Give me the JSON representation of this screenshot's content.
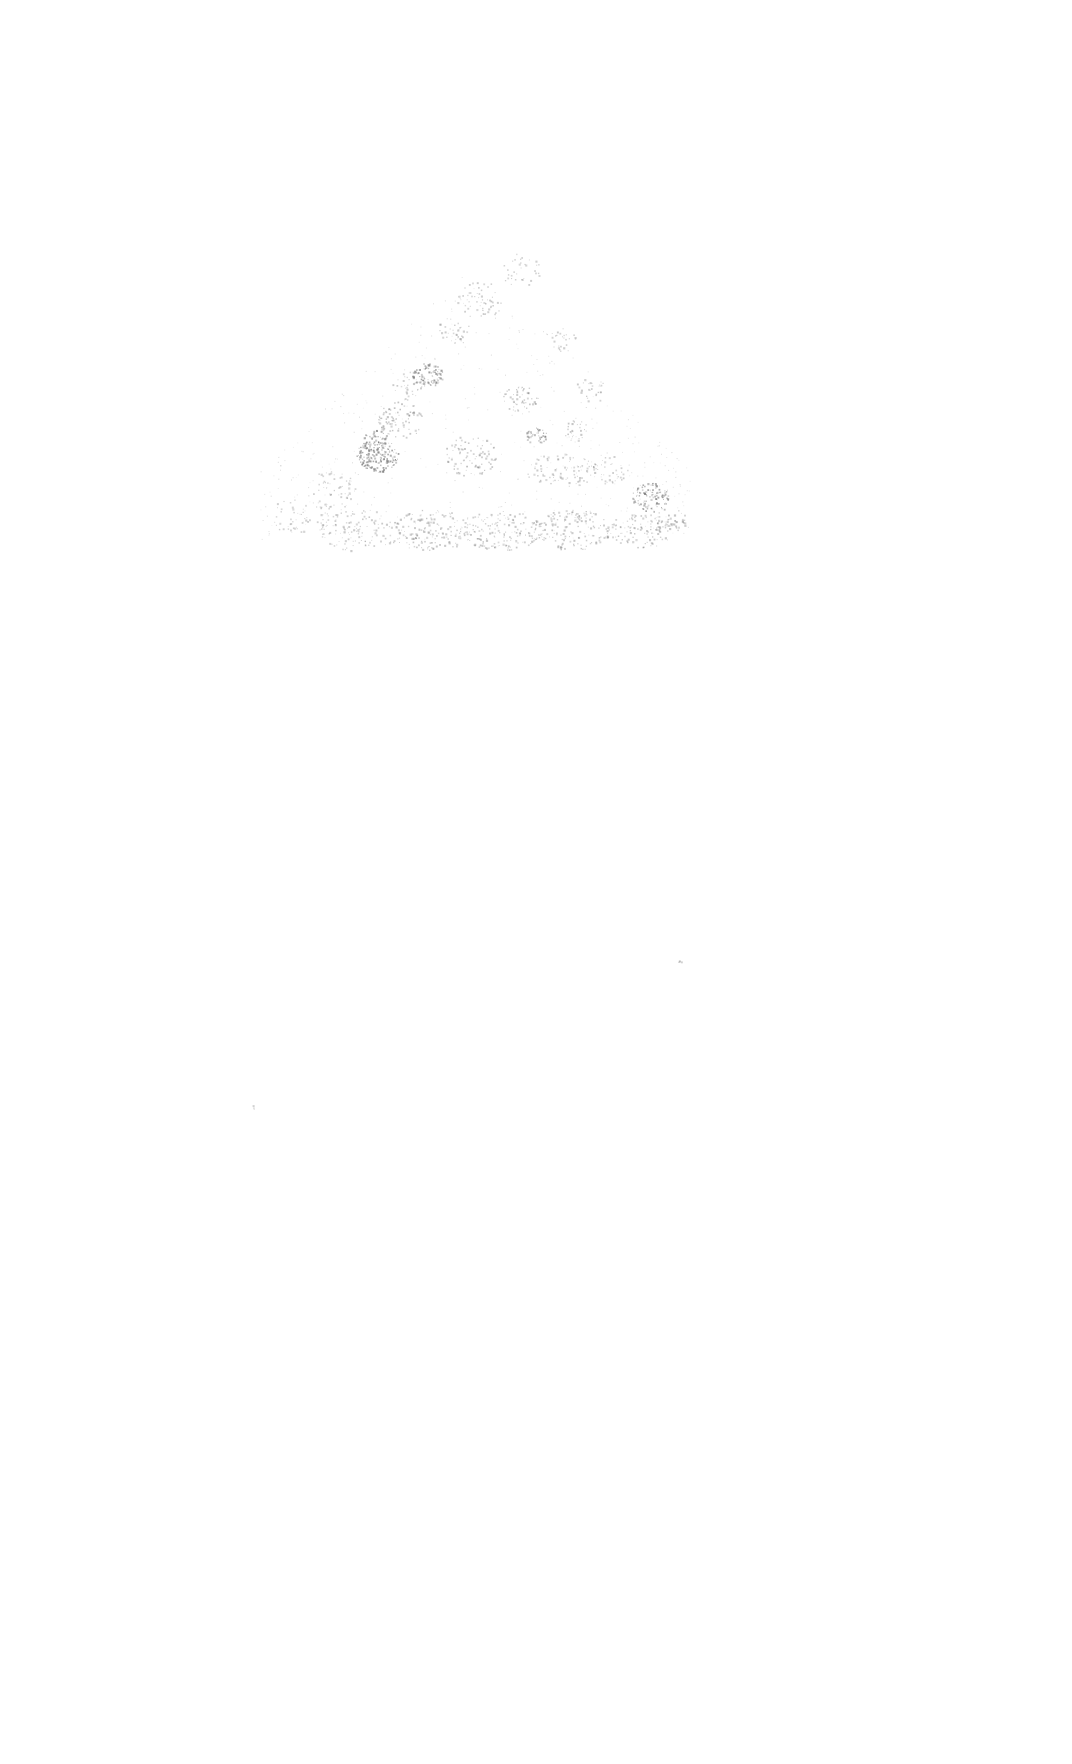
{
  "canvas": {
    "width": 1072,
    "height": 1764,
    "background": "#ffffff",
    "speckle_color": "#6f6f6f"
  },
  "texture": {
    "description": "faint grey speckled spray texture forming a low mound shape",
    "region": {
      "x": 260,
      "y": 260,
      "width": 430,
      "height": 280
    },
    "clusters": [
      {
        "x": 427,
        "y": 375,
        "r": 12,
        "density": 0.7
      },
      {
        "x": 377,
        "y": 455,
        "r": 16,
        "density": 0.75
      },
      {
        "x": 375,
        "y": 440,
        "r": 10,
        "density": 0.6
      },
      {
        "x": 536,
        "y": 435,
        "r": 8,
        "density": 0.65
      },
      {
        "x": 650,
        "y": 497,
        "r": 14,
        "density": 0.6
      },
      {
        "x": 575,
        "y": 430,
        "r": 10,
        "density": 0.3
      },
      {
        "x": 520,
        "y": 400,
        "r": 14,
        "density": 0.3
      },
      {
        "x": 480,
        "y": 300,
        "r": 18,
        "density": 0.2
      },
      {
        "x": 520,
        "y": 270,
        "r": 16,
        "density": 0.15
      },
      {
        "x": 455,
        "y": 330,
        "r": 14,
        "density": 0.2
      },
      {
        "x": 560,
        "y": 340,
        "r": 12,
        "density": 0.2
      },
      {
        "x": 400,
        "y": 420,
        "r": 18,
        "density": 0.3
      },
      {
        "x": 470,
        "y": 455,
        "r": 20,
        "density": 0.25
      },
      {
        "x": 560,
        "y": 470,
        "r": 22,
        "density": 0.2
      },
      {
        "x": 610,
        "y": 470,
        "r": 14,
        "density": 0.2
      },
      {
        "x": 330,
        "y": 490,
        "r": 20,
        "density": 0.15
      },
      {
        "x": 300,
        "y": 515,
        "r": 22,
        "density": 0.12
      },
      {
        "x": 360,
        "y": 530,
        "r": 26,
        "density": 0.2
      },
      {
        "x": 430,
        "y": 530,
        "r": 26,
        "density": 0.25
      },
      {
        "x": 500,
        "y": 530,
        "r": 26,
        "density": 0.25
      },
      {
        "x": 570,
        "y": 530,
        "r": 26,
        "density": 0.25
      },
      {
        "x": 640,
        "y": 530,
        "r": 22,
        "density": 0.25
      },
      {
        "x": 670,
        "y": 520,
        "r": 12,
        "density": 0.3
      },
      {
        "x": 410,
        "y": 385,
        "r": 14,
        "density": 0.2
      },
      {
        "x": 590,
        "y": 390,
        "r": 12,
        "density": 0.2
      },
      {
        "x": 680,
        "y": 960,
        "r": 2,
        "density": 0.5
      },
      {
        "x": 253,
        "y": 1107,
        "r": 2,
        "density": 0.3
      }
    ]
  }
}
